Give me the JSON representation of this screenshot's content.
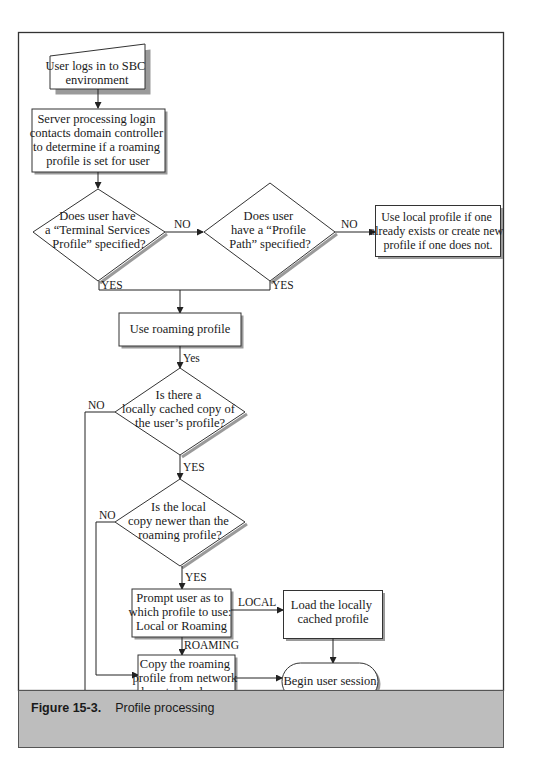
{
  "figure": {
    "label": "Figure 15-3.",
    "title": "Profile processing"
  },
  "nodes": {
    "login": {
      "type": "manual-input",
      "lines": [
        "User logs in to SBC",
        "environment"
      ]
    },
    "contact_dc": {
      "type": "process",
      "lines": [
        "Server processing login",
        "contacts domain controller",
        "to determine if a roaming",
        "profile is set for user"
      ]
    },
    "ts_profile_q": {
      "type": "decision",
      "lines": [
        "Does user have",
        "a “Terminal Services",
        "Profile” specified?"
      ]
    },
    "profile_path_q": {
      "type": "decision",
      "lines": [
        "Does user",
        "have a “Profile",
        "Path” specified?"
      ]
    },
    "use_local": {
      "type": "process",
      "lines": [
        "Use local profile if one",
        "already exists or create new",
        "profile if one does not."
      ]
    },
    "use_roaming": {
      "type": "process",
      "lines": [
        "Use roaming profile"
      ]
    },
    "cached_q": {
      "type": "decision",
      "lines": [
        "Is there a",
        "locally cached copy of",
        "the user’s profile?"
      ]
    },
    "newer_q": {
      "type": "decision",
      "lines": [
        "Is the local",
        "copy newer than the",
        "roaming profile?"
      ]
    },
    "prompt": {
      "type": "process",
      "lines": [
        "Prompt user as to",
        "which profile to use:",
        "Local or Roaming"
      ]
    },
    "load_local": {
      "type": "process",
      "lines": [
        "Load the locally",
        "cached profile"
      ]
    },
    "copy_roaming": {
      "type": "process",
      "lines": [
        "Copy the roaming",
        "profile from network",
        "share to local server"
      ]
    },
    "begin": {
      "type": "terminator",
      "lines": [
        "Begin user session"
      ]
    }
  },
  "edges": {
    "ts_no": "NO",
    "ts_yes": "YES",
    "path_no": "NO",
    "path_yes": "YES",
    "roaming_yes": "Yes",
    "cached_no": "NO",
    "cached_yes": "YES",
    "newer_no": "NO",
    "newer_yes": "YES",
    "prompt_local": "LOCAL",
    "prompt_roaming": "ROAMING"
  },
  "colors": {
    "stroke": "#333333",
    "shadow": "#9a9a9a",
    "caption_bg": "#bdbdbd"
  }
}
